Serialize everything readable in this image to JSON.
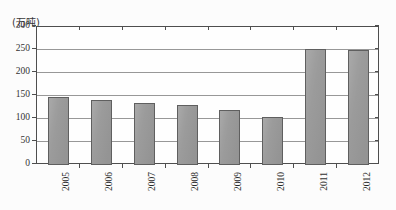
{
  "figure": {
    "unit_label": "(万吨)",
    "background_color": "#fdfdfd"
  },
  "colors": {
    "bar_fill": "#8f8f8f",
    "bar_stroke": "#4e4e4e",
    "gridline": "#8e8e8e",
    "frame": "#3c3c3c",
    "text": "#141414"
  },
  "chart_data": {
    "type": "bar",
    "title": "",
    "subtitle": "",
    "xlabel": "",
    "ylabel": "(万吨)",
    "categories": [
      "2005",
      "2006",
      "2007",
      "2008",
      "2009",
      "2010",
      "2011",
      "2012"
    ],
    "values": [
      147,
      142,
      135,
      130,
      120,
      105,
      252,
      249
    ],
    "series": [
      {
        "name": "",
        "values": [
          147,
          142,
          135,
          130,
          120,
          105,
          252,
          249
        ]
      }
    ],
    "ylim": [
      0,
      300
    ],
    "yticks": [
      0,
      50,
      100,
      150,
      200,
      250,
      300
    ],
    "ytick_labels": [
      "0",
      "50",
      "100",
      "150",
      "200",
      "250",
      "300"
    ],
    "xtick_labels": [
      "2005",
      "2006",
      "2007",
      "2008",
      "2009",
      "2010",
      "2011",
      "2012"
    ],
    "xtick_label_rotation": 90,
    "grid": true,
    "grid_axis": "y",
    "legend": false,
    "legend_position": "none",
    "annotations": []
  }
}
